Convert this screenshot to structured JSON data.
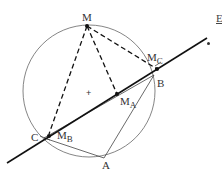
{
  "diagram": {
    "type": "geometry",
    "points": {
      "M": {
        "label": "M",
        "x": 87,
        "y": 26
      },
      "A": {
        "label": "A",
        "x": 104,
        "y": 158
      },
      "B": {
        "label": "B",
        "x": 154,
        "y": 75
      },
      "C": {
        "label": "C",
        "x": 44,
        "y": 138
      },
      "MA": {
        "label": "M",
        "sub": "A",
        "x": 117,
        "y": 94
      },
      "MB": {
        "label": "M",
        "sub": "B",
        "x": 49,
        "y": 136
      },
      "MC": {
        "label": "M",
        "sub": "C",
        "x": 157,
        "y": 69
      }
    },
    "circle": {
      "cx": 89,
      "cy": 91,
      "r": 66
    },
    "simson_line": {
      "x1": 7,
      "y1": 163,
      "x2": 207,
      "y2": 38
    },
    "center_mark": {
      "label": "+",
      "x": 89,
      "y": 92
    },
    "colors": {
      "stroke": "#222222",
      "circle": "#555555",
      "text": "#333333"
    }
  },
  "edge_text": {
    "label": "E"
  }
}
